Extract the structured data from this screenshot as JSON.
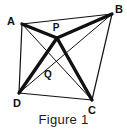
{
  "figure": {
    "caption": "Figure 1",
    "background_color": "#ffffff",
    "stroke_color": "#111111",
    "thin_stroke_width": 1,
    "thick_stroke_width": 3.2,
    "viewbox": "0 0 127 133",
    "vertices": [
      {
        "id": "A",
        "label": "A",
        "x": 22,
        "y": 24,
        "label_x": 11,
        "label_y": 21
      },
      {
        "id": "B",
        "label": "B",
        "x": 112,
        "y": 14,
        "label_x": 116,
        "label_y": 12
      },
      {
        "id": "C",
        "label": "C",
        "x": 92,
        "y": 100,
        "label_x": 89,
        "label_y": 113
      },
      {
        "id": "D",
        "label": "D",
        "x": 19,
        "y": 93,
        "label_x": 12,
        "label_y": 106
      }
    ],
    "interior_points": [
      {
        "id": "P",
        "label": "P",
        "x": 57,
        "y": 38,
        "label_x": 53,
        "label_y": 30
      },
      {
        "id": "Q",
        "label": "Q",
        "x": 51,
        "y": 65,
        "label_x": 45,
        "label_y": 77
      }
    ],
    "sides": [
      {
        "name": "side-AB",
        "from": "A",
        "to": "B",
        "weight": "thin"
      },
      {
        "name": "side-BC",
        "from": "B",
        "to": "C",
        "weight": "thin"
      },
      {
        "name": "side-CD",
        "from": "C",
        "to": "D",
        "weight": "thin"
      },
      {
        "name": "side-DA",
        "from": "D",
        "to": "A",
        "weight": "thin"
      }
    ],
    "diagonals": [
      {
        "name": "diagonal-AC",
        "from": "A",
        "to": "C",
        "weight": "thin"
      },
      {
        "name": "diagonal-BD",
        "from": "B",
        "to": "D",
        "weight": "thin"
      }
    ],
    "cevians": [
      {
        "name": "segment-AP",
        "from": "A",
        "to": "P",
        "weight": "thick"
      },
      {
        "name": "segment-PB",
        "from": "P",
        "to": "B",
        "weight": "thick"
      },
      {
        "name": "segment-DP",
        "from": "D",
        "to": "P",
        "weight": "thick"
      },
      {
        "name": "segment-PC",
        "from": "P",
        "to": "C",
        "weight": "thick"
      }
    ]
  }
}
